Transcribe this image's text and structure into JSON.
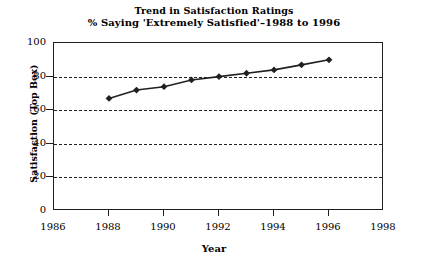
{
  "chart_data": {
    "type": "line",
    "title": "Trend in Satisfaction Ratings",
    "subtitle": "% Saying 'Extremely Satisfied'–1988 to 1996",
    "xlabel": "Year",
    "ylabel": "Satisfaction (Top Box)",
    "x": [
      1988,
      1989,
      1990,
      1991,
      1992,
      1993,
      1994,
      1995,
      1996
    ],
    "values": [
      67,
      72,
      74,
      78,
      80,
      82,
      84,
      87,
      90
    ],
    "series": [
      {
        "name": "% Extremely Satisfied",
        "values": [
          67,
          72,
          74,
          78,
          80,
          82,
          84,
          87,
          90
        ]
      }
    ],
    "xlim": [
      1986,
      1998
    ],
    "ylim": [
      0,
      100
    ],
    "xticks": [
      1986,
      1988,
      1990,
      1992,
      1994,
      1996,
      1998
    ],
    "xtick_labels": [
      "1986",
      "1988",
      "1990",
      "1992",
      "1994",
      "1996",
      "1998"
    ],
    "yticks": [
      0,
      20,
      40,
      60,
      80,
      100
    ],
    "ytick_labels": [
      "0",
      "20",
      "40",
      "60",
      "80",
      "100"
    ],
    "gridlines_y": [
      20,
      40,
      60,
      80
    ],
    "grid": "horizontal-dashed",
    "legend": "none",
    "marker": "diamond",
    "line_color": "#231f20",
    "marker_color": "#231f20",
    "axis_color": "#231f20",
    "background_color": "#ffffff"
  }
}
